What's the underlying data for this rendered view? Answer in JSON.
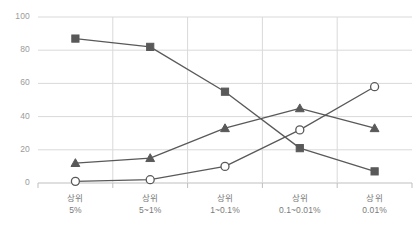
{
  "chart_data": {
    "type": "line",
    "title": "",
    "subtitle": "",
    "xlabel": "",
    "ylabel": "",
    "ylim": [
      0,
      100
    ],
    "yticks": [
      0,
      20,
      40,
      60,
      80,
      100
    ],
    "ytick_labels": [
      "0",
      "20",
      "40",
      "60",
      "80",
      "100"
    ],
    "grid": "horizontal",
    "legend": "none",
    "categories": [
      "상위 5%",
      "상위 5~1%",
      "상위 1~0.1%",
      "상위 0.1~0.01%",
      "상위 0.01%"
    ],
    "category_lines": [
      {
        "top": "상위",
        "bottom": "5%"
      },
      {
        "top": "상위",
        "bottom": "5~1%"
      },
      {
        "top": "상위",
        "bottom": "1~0.1%"
      },
      {
        "top": "상위",
        "bottom": "0.1~0.01%"
      },
      {
        "top": "상위",
        "bottom": "0.01%"
      }
    ],
    "series": [
      {
        "name": "series-square",
        "marker": "square",
        "marker_fill": "#595959",
        "line_color": "#595959",
        "values": [
          87,
          82,
          55,
          21,
          7
        ]
      },
      {
        "name": "series-triangle",
        "marker": "triangle",
        "marker_fill": "#595959",
        "line_color": "#595959",
        "values": [
          12,
          15,
          33,
          45,
          33
        ]
      },
      {
        "name": "series-circle",
        "marker": "circle",
        "marker_fill": "#ffffff",
        "line_color": "#595959",
        "values": [
          1,
          2,
          10,
          32,
          58
        ]
      }
    ],
    "colors": {
      "plot_background": "#ffffff",
      "gridline": "#d9d9d9",
      "axis_line": "#bfbfbf",
      "tick_label": "#9b9b9b",
      "category_label": "#7a7a7a",
      "series_line": "#595959"
    }
  }
}
